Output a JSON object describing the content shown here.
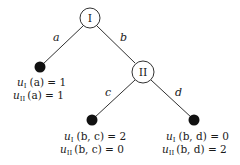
{
  "diagram": {
    "type": "extensive-form game tree",
    "nodes": [
      {
        "id": "I",
        "label": "I",
        "kind": "decision",
        "player": "I"
      },
      {
        "id": "II",
        "label": "II",
        "kind": "decision",
        "player": "II"
      },
      {
        "id": "leaf_a",
        "kind": "terminal"
      },
      {
        "id": "leaf_bc",
        "kind": "terminal"
      },
      {
        "id": "leaf_bd",
        "kind": "terminal"
      }
    ],
    "edges": [
      {
        "from": "I",
        "to": "leaf_a",
        "label": "a"
      },
      {
        "from": "I",
        "to": "II",
        "label": "b"
      },
      {
        "from": "II",
        "to": "leaf_bc",
        "label": "c"
      },
      {
        "from": "II",
        "to": "leaf_bd",
        "label": "d"
      }
    ],
    "payoffs": {
      "leaf_a": {
        "line1": {
          "u": "u",
          "sub": "I",
          "arg": "(a) = 1"
        },
        "line2": {
          "u": "u",
          "sub": "II",
          "arg": "(a) = 1"
        }
      },
      "leaf_bc": {
        "line1": {
          "u": "u",
          "sub": "I",
          "arg": "(b, c) = 2"
        },
        "line2": {
          "u": "u",
          "sub": "II",
          "arg": "(b, c) = 0"
        }
      },
      "leaf_bd": {
        "line1": {
          "u": "u",
          "sub": "I",
          "arg": "(b, d) = 0"
        },
        "line2": {
          "u": "u",
          "sub": "II",
          "arg": "(b, d) = 2"
        }
      }
    },
    "colors": {
      "stroke": "#1a1a1a",
      "terminal_fill": "#111111",
      "node_fill": "#ffffff"
    }
  }
}
